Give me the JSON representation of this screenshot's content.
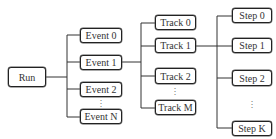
{
  "diagram": {
    "type": "hierarchy-tree",
    "root": {
      "label": "Run"
    },
    "levels": [
      {
        "name": "events",
        "items": [
          "Event 0",
          "Event 1",
          "Event 2",
          "Event N"
        ],
        "ellipsis": "⋮",
        "expanded_index": 1
      },
      {
        "name": "tracks",
        "items": [
          "Track 0",
          "Track 1",
          "Track 2",
          "Track M"
        ],
        "ellipsis": "⋮",
        "expanded_index": 1
      },
      {
        "name": "steps",
        "items": [
          "Step 0",
          "Step 1",
          "Step 2",
          "Step K"
        ],
        "ellipsis": "⋮"
      }
    ],
    "edges": [
      [
        "Run",
        "Event 0"
      ],
      [
        "Run",
        "Event 1"
      ],
      [
        "Run",
        "Event 2"
      ],
      [
        "Run",
        "Event N"
      ],
      [
        "Event 1",
        "Track 0"
      ],
      [
        "Event 1",
        "Track 1"
      ],
      [
        "Event 1",
        "Track 2"
      ],
      [
        "Event 1",
        "Track M"
      ],
      [
        "Track 1",
        "Step 0"
      ],
      [
        "Track 1",
        "Step 1"
      ],
      [
        "Track 1",
        "Step 2"
      ],
      [
        "Track 1",
        "Step K"
      ]
    ],
    "colors": {
      "line": "#333333",
      "border": "#222222",
      "text": "#333333",
      "background": "#ffffff"
    }
  }
}
